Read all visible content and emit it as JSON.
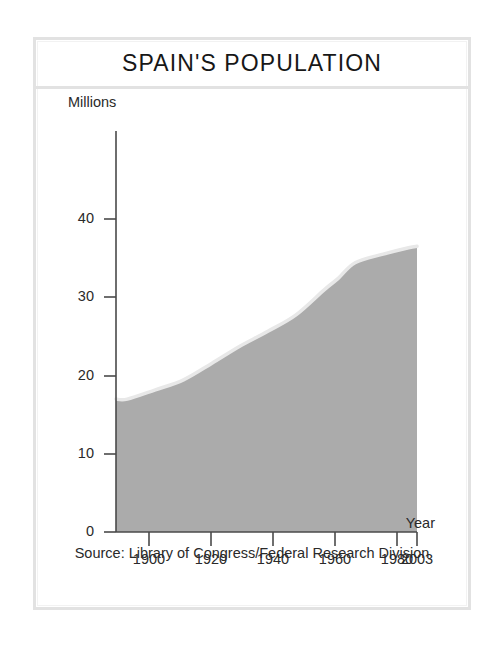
{
  "figure": {
    "title": "SPAIN'S POPULATION",
    "source": "Source: Library of Congress/Federal Research Division",
    "frame_color": "#e2e2e2",
    "background": "#ffffff"
  },
  "chart_data": {
    "type": "area",
    "title": "SPAIN'S POPULATION",
    "xlabel": "Year",
    "ylabel": "Millions",
    "xlim": [
      1896,
      2003
    ],
    "ylim": [
      0,
      45
    ],
    "xticks": [
      1900,
      1920,
      1940,
      1960,
      1980,
      2003
    ],
    "xtick_labels": [
      "1900",
      "1920",
      "1940",
      "1960",
      "1980",
      "2003"
    ],
    "yticks": [
      0,
      10,
      20,
      30,
      40
    ],
    "ytick_labels": [
      "0",
      "10",
      "20",
      "30",
      "40"
    ],
    "grid": false,
    "legend": "none",
    "fill_color": "#ababab",
    "edge_highlight_color": "#e8e8e8",
    "axis_color": "#4a4a4a",
    "series": [
      {
        "name": "Population (millions)",
        "x": [
          1896,
          1900,
          1910,
          1920,
          1930,
          1940,
          1950,
          1960,
          1970,
          1975,
          1981,
          1991,
          2000,
          2003
        ],
        "values": [
          18.6,
          18.6,
          19.9,
          21.3,
          23.6,
          26.0,
          28.1,
          30.4,
          33.9,
          35.5,
          37.7,
          38.9,
          39.8,
          40.0
        ]
      }
    ],
    "annotations": []
  },
  "axis_labels": {
    "y_title": "Millions",
    "x_title": "Year"
  }
}
